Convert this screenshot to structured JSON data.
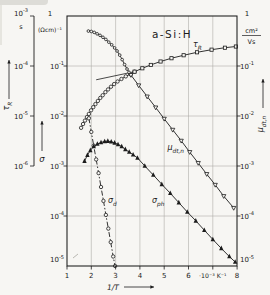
{
  "figure": {
    "title": "a-Si:H",
    "background": "#f7f6f3",
    "ink": "#1c1c1c",
    "grid_color": "#a9a7a2"
  },
  "chart_data": {
    "type": "line",
    "title": "a-Si:H",
    "grid": true,
    "x_axis": {
      "label": "1/T",
      "unit": "·10⁻³ K⁻¹",
      "range": [
        1,
        8
      ],
      "ticks": [
        1,
        2,
        3,
        4,
        5,
        6,
        7,
        8
      ],
      "tick_labels": [
        "1",
        "2",
        "3",
        "4",
        "5",
        "6",
        "·10⁻³ K⁻¹",
        "8"
      ]
    },
    "y_axis_tau": {
      "quantity": "recombination lifetime",
      "label": "τ",
      "label_sub": "R",
      "unit": "s",
      "tick_exponents": [
        -3,
        -4,
        -5,
        -6
      ],
      "range_exponents": [
        -6,
        -3
      ]
    },
    "y_axis_sigma": {
      "quantity": "conductivity",
      "label": "σ",
      "unit": "(Ωcm)⁻¹",
      "top_tick": "1",
      "tick_exponents": [
        -1,
        -2,
        -3,
        -4,
        -5
      ],
      "range_exponents": [
        -5,
        0
      ]
    },
    "y_axis_mu": {
      "quantity": "drift mobility",
      "label": "μ",
      "label_sub": "dt,n",
      "unit_numerator": "cm²",
      "unit_denominator": "Vs",
      "top_tick": "1",
      "tick_exponents": [
        -1,
        -2,
        -3,
        -4,
        -5
      ],
      "range_exponents": [
        -5,
        0
      ]
    },
    "series": [
      {
        "id": "tau-r-rise",
        "curve": "tau_R",
        "scale": "tau",
        "marker": "circle",
        "line": "solid",
        "points": [
          [
            1.58,
            5.8e-06
          ],
          [
            1.66,
            6.9e-06
          ],
          [
            1.74,
            8.1e-06
          ],
          [
            1.82,
            9.5e-06
          ],
          [
            1.9,
            1.1e-05
          ],
          [
            1.99,
            1.3e-05
          ],
          [
            2.08,
            1.5e-05
          ],
          [
            2.17,
            1.73e-05
          ],
          [
            2.27,
            2e-05
          ],
          [
            2.37,
            2.3e-05
          ],
          [
            2.47,
            2.6e-05
          ],
          [
            2.58,
            3e-05
          ],
          [
            2.69,
            3.4e-05
          ],
          [
            2.81,
            3.85e-05
          ],
          [
            2.94,
            4.35e-05
          ],
          [
            3.08,
            4.9e-05
          ],
          [
            3.24,
            5.5e-05
          ],
          [
            3.42,
            6.2e-05
          ],
          [
            3.6,
            6.9e-05
          ],
          [
            3.78,
            7.7e-05
          ]
        ]
      },
      {
        "id": "tau-r-linear",
        "curve": "tau_R",
        "scale": "tau",
        "marker": "square",
        "line": "solid",
        "points": [
          [
            3.78,
            7.7e-05
          ],
          [
            4.1,
            9e-05
          ],
          [
            4.45,
            0.000105
          ],
          [
            4.85,
            0.000123
          ],
          [
            5.3,
            0.000143
          ],
          [
            5.8,
            0.000164
          ],
          [
            6.35,
            0.000188
          ],
          [
            6.95,
            0.000212
          ],
          [
            7.5,
            0.000232
          ],
          [
            7.95,
            0.000245
          ]
        ]
      },
      {
        "id": "mu-dtn-upper",
        "curve": "mu_dt_n",
        "scale": "unit",
        "marker": "circle-small",
        "line": "solid",
        "points": [
          [
            1.88,
            0.5
          ],
          [
            2.0,
            0.49
          ],
          [
            2.12,
            0.47
          ],
          [
            2.24,
            0.44
          ],
          [
            2.36,
            0.41
          ],
          [
            2.48,
            0.375
          ],
          [
            2.6,
            0.34
          ],
          [
            2.72,
            0.3
          ],
          [
            2.84,
            0.265
          ],
          [
            2.96,
            0.23
          ],
          [
            3.06,
            0.2
          ],
          [
            3.17,
            0.165
          ],
          [
            3.27,
            0.134
          ],
          [
            3.37,
            0.107
          ],
          [
            3.47,
            0.087
          ],
          [
            3.55,
            0.075
          ],
          [
            3.63,
            0.066
          ]
        ]
      },
      {
        "id": "mu-dtn-lower",
        "curve": "mu_dt_n",
        "scale": "unit",
        "marker": "triangle-down",
        "line": "solid",
        "points": [
          [
            3.63,
            0.066
          ],
          [
            3.95,
            0.041
          ],
          [
            4.3,
            0.0245
          ],
          [
            4.65,
            0.0148
          ],
          [
            5.0,
            0.0088
          ],
          [
            5.35,
            0.0053
          ],
          [
            5.7,
            0.0032
          ],
          [
            6.05,
            0.0019
          ],
          [
            6.4,
            0.00115
          ],
          [
            6.75,
            0.00069
          ],
          [
            7.1,
            0.00042
          ],
          [
            7.45,
            0.00025
          ],
          [
            7.86,
            0.000145
          ]
        ]
      },
      {
        "id": "sigma-d",
        "curve": "sigma_d",
        "scale": "unit",
        "marker": "circle",
        "line": "dashdot",
        "points": [
          [
            1.9,
            0.009
          ],
          [
            2.0,
            0.0048
          ],
          [
            2.1,
            0.00255
          ],
          [
            2.2,
            0.00135
          ],
          [
            2.3,
            0.00072
          ],
          [
            2.4,
            0.00038
          ],
          [
            2.5,
            0.0002
          ],
          [
            2.6,
            0.000105
          ],
          [
            2.7,
            5.6e-05
          ],
          [
            2.8,
            3e-05
          ],
          [
            2.9,
            1.55e-05
          ],
          [
            2.98,
            1e-05
          ]
        ]
      },
      {
        "id": "sigma-ph",
        "curve": "sigma_ph",
        "scale": "unit",
        "marker": "triangle-up-filled",
        "line": "solid",
        "points": [
          [
            1.72,
            0.00125
          ],
          [
            1.84,
            0.00165
          ],
          [
            1.96,
            0.00205
          ],
          [
            2.1,
            0.00245
          ],
          [
            2.25,
            0.00275
          ],
          [
            2.4,
            0.00295
          ],
          [
            2.55,
            0.0031
          ],
          [
            2.68,
            0.00315
          ],
          [
            2.82,
            0.00305
          ],
          [
            2.96,
            0.0029
          ],
          [
            3.1,
            0.0027
          ],
          [
            3.25,
            0.00245
          ],
          [
            3.4,
            0.00215
          ],
          [
            3.56,
            0.0019
          ],
          [
            3.72,
            0.00168
          ],
          [
            3.9,
            0.00145
          ],
          [
            4.2,
            0.001
          ],
          [
            4.55,
            0.00066
          ],
          [
            4.9,
            0.00043
          ],
          [
            5.25,
            0.000285
          ],
          [
            5.6,
            0.000185
          ],
          [
            5.95,
            0.00012
          ],
          [
            6.3,
            8e-05
          ],
          [
            6.65,
            5.2e-05
          ],
          [
            7.0,
            3.4e-05
          ],
          [
            7.35,
            2.25e-05
          ],
          [
            7.68,
            1.55e-05
          ],
          [
            7.92,
            1.2e-05
          ]
        ]
      }
    ],
    "curve_labels": [
      {
        "text": "τ",
        "sub": "R",
        "x_px": 193,
        "y_px": 47,
        "anchor": "start"
      },
      {
        "text": "μ",
        "sub": "dt,n",
        "x_px": 184,
        "y_px": 150,
        "anchor": "end"
      },
      {
        "text": "σ",
        "sub": "d",
        "x_px": 108,
        "y_px": 203,
        "anchor": "start"
      },
      {
        "text": "σ",
        "sub": "ph",
        "x_px": 152,
        "y_px": 203,
        "anchor": "start"
      }
    ],
    "guide_line": {
      "x1": 2.2,
      "v1": 0.053,
      "x2": 3.72,
      "v2": 0.076,
      "scale": "unit"
    }
  }
}
